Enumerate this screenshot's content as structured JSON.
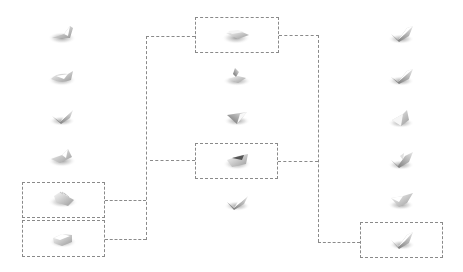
{
  "diagram": {
    "type": "hierarchical-selection",
    "colors": {
      "line": "#8a8a8a",
      "shape_light": "#f2f2f2",
      "shape_dark": "#6e6e6e",
      "shadow": "#b0b0b0"
    },
    "columns": [
      {
        "id": "left",
        "shapes": [
          {
            "id": "L1",
            "x": 63,
            "y": 34,
            "form": "folded-a"
          },
          {
            "id": "L2",
            "x": 63,
            "y": 76,
            "form": "wedge-a"
          },
          {
            "id": "L3",
            "x": 63,
            "y": 116,
            "form": "check-a"
          },
          {
            "id": "L4",
            "x": 63,
            "y": 157,
            "form": "folded-b"
          },
          {
            "id": "L5",
            "x": 63,
            "y": 198,
            "form": "ridged",
            "selected": true
          },
          {
            "id": "L6",
            "x": 63,
            "y": 238,
            "form": "wedge-b",
            "selected": true
          }
        ]
      },
      {
        "id": "center",
        "shapes": [
          {
            "id": "C1",
            "x": 237,
            "y": 34,
            "form": "flat-pair",
            "selected": true
          },
          {
            "id": "C2",
            "x": 237,
            "y": 76,
            "form": "spire"
          },
          {
            "id": "C3",
            "x": 237,
            "y": 117,
            "form": "v-fold"
          },
          {
            "id": "C4",
            "x": 237,
            "y": 160,
            "form": "wedge-c",
            "selected": true
          },
          {
            "id": "C5",
            "x": 237,
            "y": 202,
            "form": "check-b"
          }
        ]
      },
      {
        "id": "right",
        "shapes": [
          {
            "id": "R1",
            "x": 402,
            "y": 34,
            "form": "check-c"
          },
          {
            "id": "R2",
            "x": 402,
            "y": 76,
            "form": "check-d"
          },
          {
            "id": "R3",
            "x": 402,
            "y": 118,
            "form": "pyramid"
          },
          {
            "id": "R4",
            "x": 402,
            "y": 160,
            "form": "check-e"
          },
          {
            "id": "R5",
            "x": 402,
            "y": 200,
            "form": "wedge-d"
          },
          {
            "id": "R6",
            "x": 402,
            "y": 240,
            "form": "check-f",
            "selected": true
          }
        ]
      }
    ],
    "boxes": [
      {
        "id": "box-L5",
        "x": 22,
        "y": 182,
        "w": 83,
        "h": 36
      },
      {
        "id": "box-L6",
        "x": 22,
        "y": 220,
        "w": 83,
        "h": 37
      },
      {
        "id": "box-C1",
        "x": 195,
        "y": 17,
        "w": 84,
        "h": 36
      },
      {
        "id": "box-C4",
        "x": 195,
        "y": 143,
        "w": 83,
        "h": 36
      },
      {
        "id": "box-R6",
        "x": 360,
        "y": 222,
        "w": 83,
        "h": 36
      }
    ],
    "connections": [
      {
        "from": "L5",
        "to": "C1",
        "via": "left-bracket"
      },
      {
        "from": "L6",
        "to": "C1",
        "via": "left-bracket"
      },
      {
        "from": "C1",
        "to": "R6",
        "via": "right-bracket"
      },
      {
        "from": "C4",
        "to": "right-bracket"
      },
      {
        "from": "left-bracket",
        "to": "C4"
      }
    ]
  }
}
